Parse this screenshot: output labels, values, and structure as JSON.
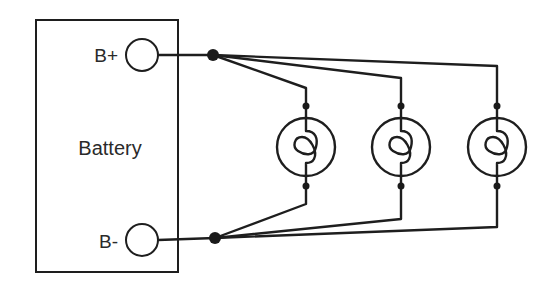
{
  "diagram": {
    "battery": {
      "label": "Battery",
      "positive_terminal_label": "B+",
      "negative_terminal_label": "B-"
    },
    "bulbs": [
      {
        "name": "Bulb 1"
      },
      {
        "name": "Bulb 2"
      },
      {
        "name": "Bulb 3"
      }
    ],
    "colors": {
      "line": "#1e1e1e",
      "background": "#ffffff"
    }
  }
}
